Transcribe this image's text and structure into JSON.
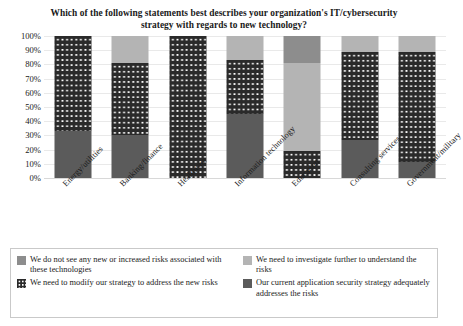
{
  "chart_data": {
    "type": "bar",
    "subtype": "stacked-bar-100-percent",
    "title": "Which of the following statements best describes your organization's IT/cybersecurity strategy with regards to new technology?",
    "xlabel": "",
    "ylabel": "",
    "ylim": [
      0,
      100
    ],
    "ytick_labels": [
      "100%",
      "90%",
      "80%",
      "70%",
      "60%",
      "50%",
      "40%",
      "30%",
      "20%",
      "10%",
      "0%"
    ],
    "ytick_values": [
      100,
      90,
      80,
      70,
      60,
      50,
      40,
      30,
      20,
      10,
      0
    ],
    "grid": true,
    "legend_position": "bottom",
    "categories": [
      "Energy/utilities",
      "Banking/finance",
      "Healthcare",
      "Information technology",
      "Education",
      "Consulting services",
      "Government/military"
    ],
    "series": [
      {
        "name": "Our current application security strategy adequately addresses the risks",
        "key": "current",
        "color": "#5b5b5b",
        "values": [
          33,
          30,
          0,
          45,
          0,
          27,
          11
        ]
      },
      {
        "name": "We need to modify our strategy to address the new risks",
        "key": "modify",
        "color": "#2a2a2a",
        "pattern": "dots",
        "values": [
          67,
          51,
          100,
          38,
          19,
          62,
          78
        ]
      },
      {
        "name": "We need to investigate further to understand the risks",
        "key": "invest",
        "color": "#b4b4b4",
        "values": [
          0,
          19,
          0,
          17,
          62,
          11,
          11
        ]
      },
      {
        "name": "We do not see any new or increased risks associated with these technologies",
        "key": "nonew",
        "color": "#8d8d8d",
        "values": [
          0,
          0,
          0,
          0,
          19,
          0,
          0
        ]
      }
    ],
    "stack_order_bottom_to_top": [
      "current",
      "modify",
      "invest",
      "nonew"
    ]
  },
  "legend": {
    "items": [
      {
        "key": "nonew",
        "label": "We do not see any new or increased risks associated with these technologies"
      },
      {
        "key": "invest",
        "label": "We need to investigate further to understand the risks"
      },
      {
        "key": "modify",
        "label": "We need to modify our strategy to address the new risks"
      },
      {
        "key": "current",
        "label": "Our current application security strategy adequately addresses the risks"
      }
    ]
  }
}
